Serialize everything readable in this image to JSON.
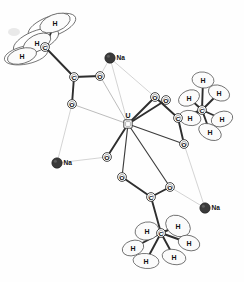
{
  "figure": {
    "kind": "ortep-crystal-structure",
    "title": "",
    "background_color": "#ffffff",
    "line_color": "#2e2e2e",
    "sodium_color": "#3a3a3a",
    "width": 244,
    "height": 282
  },
  "chart_data": {
    "type": "scatter",
    "title": "",
    "xlabel": "",
    "ylabel": "",
    "legend": [],
    "atoms": [
      {
        "id": "U1",
        "label": "U",
        "element": "U",
        "x": 128,
        "y": 124,
        "marker": "square-ring"
      },
      {
        "id": "Na1",
        "label": "Na",
        "element": "Na",
        "x": 110,
        "y": 58,
        "marker": "filled-circle"
      },
      {
        "id": "Na2",
        "label": "Na",
        "element": "Na",
        "x": 57,
        "y": 163,
        "marker": "filled-circle"
      },
      {
        "id": "Na3",
        "label": "Na",
        "element": "Na",
        "x": 205,
        "y": 208,
        "marker": "filled-circle"
      },
      {
        "id": "O1",
        "label": "O",
        "element": "O",
        "x": 100,
        "y": 76,
        "marker": "ring"
      },
      {
        "id": "O2",
        "label": "O",
        "element": "O",
        "x": 72,
        "y": 104,
        "marker": "ring"
      },
      {
        "id": "O3",
        "label": "O",
        "element": "O",
        "x": 155,
        "y": 97,
        "marker": "ring"
      },
      {
        "id": "O4",
        "label": "O",
        "element": "O",
        "x": 166,
        "y": 100,
        "marker": "ring"
      },
      {
        "id": "O5",
        "label": "O",
        "element": "O",
        "x": 184,
        "y": 144,
        "marker": "ring"
      },
      {
        "id": "O6",
        "label": "O",
        "element": "O",
        "x": 107,
        "y": 157,
        "marker": "ring"
      },
      {
        "id": "O7",
        "label": "O",
        "element": "O",
        "x": 122,
        "y": 177,
        "marker": "ring"
      },
      {
        "id": "O8",
        "label": "O",
        "element": "O",
        "x": 170,
        "y": 187,
        "marker": "ring"
      },
      {
        "id": "C1",
        "label": "C",
        "element": "C",
        "x": 74,
        "y": 77,
        "marker": "ring"
      },
      {
        "id": "C2",
        "label": "C",
        "element": "C",
        "x": 45,
        "y": 47,
        "marker": "ring"
      },
      {
        "id": "C3",
        "label": "C",
        "element": "C",
        "x": 178,
        "y": 118,
        "marker": "ring"
      },
      {
        "id": "C4",
        "label": "C",
        "element": "C",
        "x": 202,
        "y": 110,
        "marker": "ring"
      },
      {
        "id": "C5",
        "label": "C",
        "element": "C",
        "x": 151,
        "y": 197,
        "marker": "ring"
      },
      {
        "id": "C6",
        "label": "C",
        "element": "C",
        "x": 161,
        "y": 233,
        "marker": "ring"
      }
    ],
    "hydrogens": [
      {
        "id": "H1",
        "label": "H",
        "x": 55,
        "y": 23,
        "rx": 16,
        "ry": 8.5,
        "rot": -22,
        "group": "methyl-top-left"
      },
      {
        "id": "H2",
        "label": "H",
        "x": 37,
        "y": 43,
        "rx": 15,
        "ry": 8,
        "rot": -28,
        "group": "methyl-top-left"
      },
      {
        "id": "H3",
        "label": "H",
        "x": 22,
        "y": 56,
        "rx": 15,
        "ry": 7.5,
        "rot": -16,
        "group": "methyl-top-left"
      },
      {
        "id": "H4",
        "label": "H",
        "x": 203,
        "y": 80,
        "rx": 11,
        "ry": 8,
        "rot": 8,
        "group": "methyl-right"
      },
      {
        "id": "H5",
        "label": "H",
        "x": 189,
        "y": 98,
        "rx": 11,
        "ry": 7.5,
        "rot": -25,
        "group": "methyl-right"
      },
      {
        "id": "H6",
        "label": "H",
        "x": 219,
        "y": 93,
        "rx": 11,
        "ry": 7.5,
        "rot": 22,
        "group": "methyl-right"
      },
      {
        "id": "H7",
        "label": "H",
        "x": 190,
        "y": 118,
        "rx": 11,
        "ry": 7.5,
        "rot": 10,
        "group": "methyl-right"
      },
      {
        "id": "H8",
        "label": "H",
        "x": 222,
        "y": 119,
        "rx": 11,
        "ry": 7.5,
        "rot": -18,
        "group": "methyl-right"
      },
      {
        "id": "H9",
        "label": "H",
        "x": 210,
        "y": 132,
        "rx": 12,
        "ry": 7.5,
        "rot": 26,
        "group": "methyl-right"
      },
      {
        "id": "H10",
        "label": "H",
        "x": 147,
        "y": 231,
        "rx": 12,
        "ry": 9,
        "rot": -10,
        "group": "methyl-bottom"
      },
      {
        "id": "H11",
        "label": "H",
        "x": 178,
        "y": 226,
        "rx": 13,
        "ry": 10,
        "rot": 30,
        "group": "methyl-bottom"
      },
      {
        "id": "H12",
        "label": "H",
        "x": 133,
        "y": 248,
        "rx": 11,
        "ry": 7.5,
        "rot": -18,
        "group": "methyl-bottom"
      },
      {
        "id": "H13",
        "label": "H",
        "x": 189,
        "y": 243,
        "rx": 11,
        "ry": 7.5,
        "rot": 16,
        "group": "methyl-bottom"
      },
      {
        "id": "H14",
        "label": "H",
        "x": 146,
        "y": 261,
        "rx": 13,
        "ry": 7.5,
        "rot": 6,
        "group": "methyl-bottom"
      },
      {
        "id": "H15",
        "label": "H",
        "x": 174,
        "y": 257,
        "rx": 12,
        "ry": 7.5,
        "rot": 12,
        "group": "methyl-bottom"
      }
    ],
    "bonds": [
      {
        "from": "U1",
        "to": "O1",
        "style": "thin"
      },
      {
        "from": "U1",
        "to": "O2",
        "style": "thin"
      },
      {
        "from": "U1",
        "to": "O3",
        "style": "strong"
      },
      {
        "from": "U1",
        "to": "O4",
        "style": "strong"
      },
      {
        "from": "U1",
        "to": "O5",
        "style": "med"
      },
      {
        "from": "U1",
        "to": "O6",
        "style": "strong"
      },
      {
        "from": "U1",
        "to": "O7",
        "style": "med"
      },
      {
        "from": "U1",
        "to": "O8",
        "style": "med"
      },
      {
        "from": "O1",
        "to": "C1",
        "style": "strong"
      },
      {
        "from": "O2",
        "to": "C1",
        "style": "strong"
      },
      {
        "from": "C1",
        "to": "C2",
        "style": "strong"
      },
      {
        "from": "O3",
        "to": "C3",
        "style": "strong"
      },
      {
        "from": "O5",
        "to": "C3",
        "style": "strong"
      },
      {
        "from": "C3",
        "to": "C4",
        "style": "strong"
      },
      {
        "from": "O7",
        "to": "C5",
        "style": "strong"
      },
      {
        "from": "O8",
        "to": "C5",
        "style": "strong"
      },
      {
        "from": "C5",
        "to": "C6",
        "style": "strong"
      },
      {
        "from": "Na1",
        "to": "O1",
        "style": "vthin"
      },
      {
        "from": "Na1",
        "to": "O3",
        "style": "vthin"
      },
      {
        "from": "Na1",
        "to": "U1",
        "style": "vthin"
      },
      {
        "from": "Na2",
        "to": "O2",
        "style": "vthin"
      },
      {
        "from": "Na2",
        "to": "O6",
        "style": "vthin"
      },
      {
        "from": "Na3",
        "to": "O5",
        "style": "vthin"
      },
      {
        "from": "Na3",
        "to": "O8",
        "style": "vthin"
      }
    ],
    "h_bonds": [
      {
        "from": "C2",
        "to": "H1"
      },
      {
        "from": "C2",
        "to": "H2"
      },
      {
        "from": "C2",
        "to": "H3"
      },
      {
        "from": "C4",
        "to": "H4"
      },
      {
        "from": "C4",
        "to": "H5"
      },
      {
        "from": "C4",
        "to": "H6"
      },
      {
        "from": "C4",
        "to": "H7"
      },
      {
        "from": "C4",
        "to": "H8"
      },
      {
        "from": "C4",
        "to": "H9"
      },
      {
        "from": "C6",
        "to": "H10"
      },
      {
        "from": "C6",
        "to": "H11"
      },
      {
        "from": "C6",
        "to": "H12"
      },
      {
        "from": "C6",
        "to": "H13"
      },
      {
        "from": "C6",
        "to": "H14"
      },
      {
        "from": "C6",
        "to": "H15"
      }
    ],
    "ellipsoids": [
      {
        "x": 52,
        "y": 26,
        "rx": 25,
        "ry": 10,
        "rot": -20
      },
      {
        "x": 36,
        "y": 41,
        "rx": 24,
        "ry": 10,
        "rot": -22
      },
      {
        "x": 26,
        "y": 55,
        "rx": 22,
        "ry": 9,
        "rot": -12
      }
    ]
  }
}
